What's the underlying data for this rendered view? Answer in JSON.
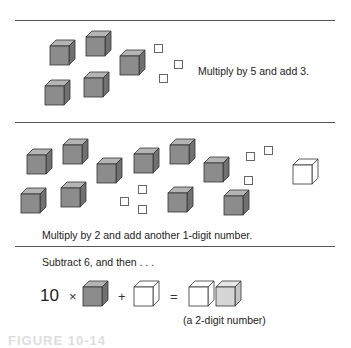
{
  "colors": {
    "cube_front": "#8c8c8c",
    "cube_top": "#b4b4b4",
    "cube_side": "#707070",
    "light_cube_front": "#d6d6d6",
    "light_cube_top": "#e6e6e6",
    "light_cube_side": "#c4c4c4",
    "rule": "#555555"
  },
  "panel1": {
    "instruction": "Multiply by 5 and add 3.",
    "gray_cubes": [
      [
        50,
        46
      ],
      [
        86,
        37
      ],
      [
        120,
        56
      ],
      [
        45,
        86
      ],
      [
        84,
        78
      ]
    ],
    "unit_squares": [
      [
        154,
        44
      ],
      [
        174,
        60
      ],
      [
        159,
        74
      ]
    ]
  },
  "panel2": {
    "instruction": "Multiply by 2 and add another 1-digit number.",
    "gray_cubes": [
      [
        27,
        155
      ],
      [
        63,
        145
      ],
      [
        97,
        164
      ],
      [
        134,
        154
      ],
      [
        170,
        145
      ],
      [
        204,
        163
      ],
      [
        21,
        194
      ],
      [
        61,
        188
      ],
      [
        168,
        193
      ],
      [
        224,
        196
      ]
    ],
    "unit_squares": [
      [
        246,
        152
      ],
      [
        264,
        146
      ],
      [
        244,
        176
      ],
      [
        138,
        185
      ],
      [
        120,
        197
      ],
      [
        138,
        205
      ]
    ],
    "white_cube": [
      293,
      165
    ]
  },
  "panel3": {
    "instruction": "Subtract 6, and then . . .",
    "equation": {
      "multiplier": "10",
      "times": "×",
      "plus": "+",
      "equals": "="
    },
    "result_caption": "(a 2-digit number)"
  },
  "figure_caption": "FIGURE 10-14"
}
